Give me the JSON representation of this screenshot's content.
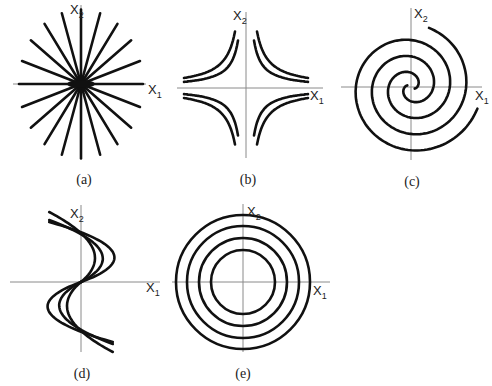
{
  "figure": {
    "panels": [
      {
        "id": "a",
        "caption": "(a)",
        "type": "star-node",
        "center": [
          81,
          84
        ],
        "axis_h": [
          13,
          146
        ],
        "axis_v": [
          5,
          158
        ],
        "x1_label": "X",
        "x1_sub": "1",
        "x2_label": "X",
        "x2_sub": "2",
        "x1_label_pos": [
          148,
          94
        ],
        "x2_label_pos": [
          70,
          14
        ],
        "caption_pos": [
          84,
          184
        ],
        "ray_count": 20,
        "ray_radius": 62
      },
      {
        "id": "b",
        "caption": "(b)",
        "type": "saddle",
        "center": [
          246,
          88
        ],
        "axis_h": [
          177,
          323
        ],
        "axis_v": [
          12,
          158
        ],
        "x1_label": "X",
        "x1_sub": "1",
        "x2_label": "X",
        "x2_sub": "2",
        "x1_label_pos": [
          310,
          100
        ],
        "x2_label_pos": [
          233,
          20
        ],
        "caption_pos": [
          248,
          184
        ]
      },
      {
        "id": "c",
        "caption": "(c)",
        "type": "spiral",
        "center": [
          411,
          87
        ],
        "axis_h": [
          341,
          482
        ],
        "axis_v": [
          8,
          160
        ],
        "x1_label": "X",
        "x1_sub": "1",
        "x2_label": "X",
        "x2_sub": "2",
        "x1_label_pos": [
          475,
          100
        ],
        "x2_label_pos": [
          414,
          18
        ],
        "caption_pos": [
          412,
          186
        ]
      },
      {
        "id": "d",
        "caption": "(d)",
        "type": "degenerate-node",
        "center": [
          81,
          282
        ],
        "axis_h": [
          10,
          160
        ],
        "axis_v": [
          205,
          352
        ],
        "x1_label": "X",
        "x1_sub": "1",
        "x2_label": "X",
        "x2_sub": "2",
        "x1_label_pos": [
          146,
          292
        ],
        "x2_label_pos": [
          70,
          218
        ],
        "caption_pos": [
          82,
          378
        ]
      },
      {
        "id": "e",
        "caption": "(e)",
        "type": "center",
        "center": [
          243,
          282
        ],
        "axis_h": [
          172,
          330
        ],
        "axis_v": [
          204,
          352
        ],
        "x1_label": "X",
        "x1_sub": "1",
        "x2_label": "X",
        "x2_sub": "2",
        "x1_label_pos": [
          313,
          295
        ],
        "x2_label_pos": [
          247,
          216
        ],
        "caption_pos": [
          243,
          378
        ],
        "circle_radii": [
          67,
          56,
          44,
          32
        ]
      }
    ]
  }
}
